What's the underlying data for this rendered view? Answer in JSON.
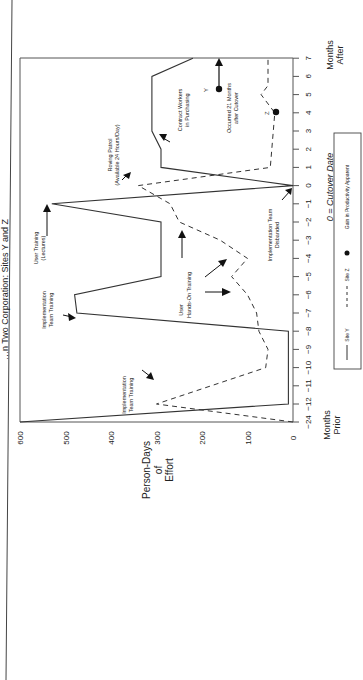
{
  "chart_data": {
    "type": "line",
    "orientation": "rotated 90 degrees counterclockwise",
    "xlabel_left": "Months Prior",
    "xlabel_right": "Months After",
    "x_center_label": "0 = Cutover Date",
    "ylabel": "Person-Days of Effort",
    "ylim": [
      0,
      600
    ],
    "y_ticks": [
      0,
      100,
      200,
      300,
      400,
      500,
      600
    ],
    "x_ticks": [
      "-24",
      "-12",
      "-11",
      "-10",
      "-9",
      "-8",
      "-7",
      "-6",
      "-5",
      "-4",
      "-3",
      "-2",
      "-1",
      "0",
      "1",
      "2",
      "3",
      "4",
      "5",
      "6",
      "7"
    ],
    "grid": false,
    "series": [
      {
        "name": "Site Y",
        "style": "solid",
        "points": [
          {
            "x": -24,
            "y": 600
          },
          {
            "x": -12,
            "y": 10
          },
          {
            "x": -8,
            "y": 10
          },
          {
            "x": -7,
            "y": 475
          },
          {
            "x": -6,
            "y": 480
          },
          {
            "x": -5,
            "y": 290
          },
          {
            "x": -2,
            "y": 290
          },
          {
            "x": -1,
            "y": 530
          },
          {
            "x": 0,
            "y": 0
          },
          {
            "x": 1,
            "y": 290
          },
          {
            "x": 2,
            "y": 290
          },
          {
            "x": 3,
            "y": 310
          },
          {
            "x": 6,
            "y": 310
          },
          {
            "x": 7,
            "y": 220
          }
        ]
      },
      {
        "name": "Site Z",
        "style": "dashed",
        "points": [
          {
            "x": -24,
            "y": 0
          },
          {
            "x": -12,
            "y": 300
          },
          {
            "x": -10,
            "y": 60
          },
          {
            "x": -9,
            "y": 55
          },
          {
            "x": -8,
            "y": 75
          },
          {
            "x": -7,
            "y": 80
          },
          {
            "x": -6,
            "y": 100
          },
          {
            "x": -5,
            "y": 135
          },
          {
            "x": -4,
            "y": 100
          },
          {
            "x": -3,
            "y": 160
          },
          {
            "x": -2,
            "y": 250
          },
          {
            "x": -1,
            "y": 270
          },
          {
            "x": 0,
            "y": 340
          },
          {
            "x": 1,
            "y": 50
          },
          {
            "x": 4,
            "y": 40
          },
          {
            "x": 5,
            "y": 70
          },
          {
            "x": 5.5,
            "y": 55
          },
          {
            "x": 6,
            "y": 55
          },
          {
            "x": 7,
            "y": 55
          }
        ]
      }
    ],
    "markers": [
      {
        "label": "Y",
        "x": 5.3,
        "y": 160,
        "note": "Occurred 21 Months after Cutover"
      },
      {
        "label": "Z",
        "x": 4,
        "y": 40
      }
    ],
    "annotations": [
      {
        "text": "Implementation Team Training",
        "series": "Site Z",
        "x": -12
      },
      {
        "text": "Implementation Team Training",
        "series": "Site Y",
        "x": -7
      },
      {
        "text": "User Training (Lectures)",
        "series": "Site Y",
        "x": -1
      },
      {
        "text": "User Hands-On Training",
        "series": "Site Z",
        "x": -5
      },
      {
        "text": "Implementation Team Disbanded",
        "series": "Site Y",
        "x": 0
      },
      {
        "text": "Roving Patrol (Available 24 Hours/Day)",
        "series": "Site Z",
        "x": 0
      },
      {
        "text": "Contract Workers in Purchasing",
        "series": "Site Y",
        "x": 4
      },
      {
        "text": "Occurred 21 Months after Cutover",
        "series": "Site Y",
        "x": 5.5
      }
    ],
    "legend": [
      {
        "label": "Site Y",
        "style": "solid"
      },
      {
        "label": "Site Z",
        "style": "dashed"
      },
      {
        "label": "Gain in Productivity Apparent",
        "style": "dot"
      }
    ],
    "legend_position": "bottom (rotated: right side)"
  },
  "text": {
    "title": "…n Two Corporation: Sites Y and Z",
    "ylabel_l1": "Person-Days",
    "ylabel_l2": "of",
    "ylabel_l3": "Effort",
    "months_prior_1": "Months",
    "months_prior_2": "Prior",
    "months_after_1": "Months",
    "months_after_2": "After",
    "cutover": "0 = Cutover Date",
    "ann_itt1_a": "Implementation",
    "ann_itt1_b": "Team Training",
    "ann_itt2_a": "Implementation",
    "ann_itt2_b": "Team Training",
    "ann_ut_a": "User Training",
    "ann_ut_b": "(Lectures)",
    "ann_uho_a": "User",
    "ann_uho_b": "Hands-On Training",
    "ann_itd_a": "Implementation Team",
    "ann_itd_b": "Disbanded",
    "ann_rp_a": "Roving Patrol",
    "ann_rp_b": "(Available 24 Hours/Day)",
    "ann_cw_a": "Contract Workers",
    "ann_cw_b": "in Purchasing",
    "ann_oc_a": "Occurred 21 Months",
    "ann_oc_b": "after Cutover",
    "marker_y": "Y",
    "marker_z": "Z",
    "legend_y": "Site Y",
    "legend_z": "Site Z",
    "legend_dot": "Gain in Productivity Apparent"
  },
  "colors": {
    "line": "#333333",
    "text": "#222222",
    "background": "#ffffff"
  }
}
